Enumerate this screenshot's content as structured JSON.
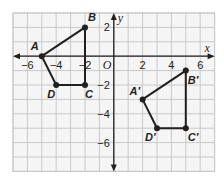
{
  "diagram": {
    "type": "coordinate-plane-translation",
    "grid": {
      "x_min": -7,
      "x_max": 7,
      "y_min": -8,
      "y_max": 3,
      "grid_color": "#c8c8c8",
      "background": "#f5f5f5"
    },
    "axes": {
      "x_label": "x",
      "y_label": "y",
      "origin_label": "O",
      "x_ticks": [
        {
          "value": -6,
          "label": "−6"
        },
        {
          "value": -4,
          "label": "−4"
        },
        {
          "value": -2,
          "label": "−2"
        },
        {
          "value": 2,
          "label": "2"
        },
        {
          "value": 4,
          "label": "4"
        },
        {
          "value": 6,
          "label": "6"
        }
      ],
      "y_ticks": [
        {
          "value": 2,
          "label": "2"
        },
        {
          "value": -2,
          "label": "−2"
        },
        {
          "value": -4,
          "label": "−4"
        },
        {
          "value": -6,
          "label": "−6"
        }
      ]
    },
    "preimage": {
      "name": "ABCD",
      "vertices": [
        {
          "label": "A",
          "x": -5,
          "y": 0
        },
        {
          "label": "B",
          "x": -2,
          "y": 2
        },
        {
          "label": "C",
          "x": -2,
          "y": -2
        },
        {
          "label": "D",
          "x": -4,
          "y": -2
        }
      ]
    },
    "image": {
      "name": "A'B'C'D'",
      "vertices": [
        {
          "label": "A′",
          "x": 2,
          "y": -3
        },
        {
          "label": "B′",
          "x": 5,
          "y": -1
        },
        {
          "label": "C′",
          "x": 5,
          "y": -5
        },
        {
          "label": "D′",
          "x": 3,
          "y": -5
        }
      ]
    },
    "line_color": "#231f20"
  }
}
